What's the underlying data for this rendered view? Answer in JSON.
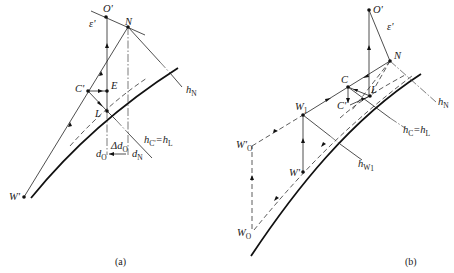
{
  "figure": {
    "panels": [
      {
        "id": "a",
        "caption": "(a)",
        "points": {
          "O_prime": "O'",
          "N": "N",
          "C_prime": "C'",
          "E": "E",
          "L": "L",
          "W_prime": "W'"
        },
        "labels": {
          "epsilon": "ε'",
          "h_N": "h",
          "h_N_sub": "N",
          "h_C_eq": "h",
          "h_C_sub": "C'",
          "h_L": "=h",
          "h_L_sub": "L",
          "d_O": "d",
          "d_O_sub": "O",
          "delta_d_O": "Δd",
          "delta_d_O_sub": "O",
          "d_N": "d",
          "d_N_sub": "N"
        }
      },
      {
        "id": "b",
        "caption": "(b)",
        "points": {
          "O_prime": "O'",
          "N": "N",
          "C": "C",
          "C_prime": "C'",
          "L": "L",
          "W1": "W",
          "W1_sub": "1",
          "W_prime": "W'",
          "W0_prime": "W'",
          "W0_prime_sub": "O",
          "W0": "W",
          "W0_sub": "O"
        },
        "labels": {
          "epsilon": "ε'",
          "h_N": "h",
          "h_N_sub": "N",
          "h_C": "h",
          "h_C_sub": "C",
          "h_L": "=h",
          "h_L_sub": "L",
          "h_W1": "h",
          "h_W1_sub": "W",
          "h_W1_subsub": "1"
        }
      }
    ],
    "colors": {
      "line": "#222222",
      "background": "#ffffff"
    }
  }
}
